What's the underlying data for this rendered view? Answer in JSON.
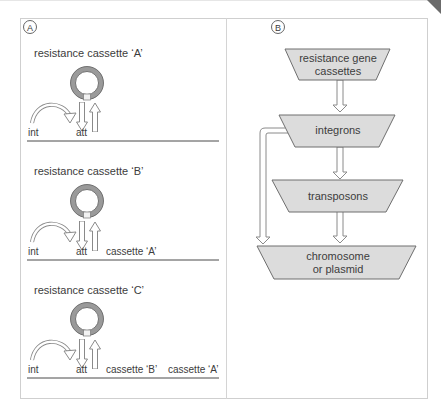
{
  "panel_a": {
    "label": "A",
    "scenarios": [
      {
        "title": "resistance cassette ‘A’",
        "int": "int",
        "att": "att",
        "downstream": []
      },
      {
        "title": "resistance cassette ‘B’",
        "int": "int",
        "att": "att",
        "downstream": [
          "cassette ‘A’"
        ]
      },
      {
        "title": "resistance cassette ‘C’",
        "int": "int",
        "att": "att",
        "downstream": [
          "cassette ‘B’",
          "cassette ‘A’"
        ]
      }
    ]
  },
  "panel_b": {
    "label": "B",
    "nodes": [
      {
        "id": "cassettes",
        "line1": "resistance gene",
        "line2": "cassettes"
      },
      {
        "id": "integrons",
        "line1": "integrons",
        "line2": ""
      },
      {
        "id": "transposons",
        "line1": "transposons",
        "line2": ""
      },
      {
        "id": "chromosome",
        "line1": "chromosome",
        "line2": "or plasmid"
      }
    ],
    "edges": [
      [
        "cassettes",
        "integrons"
      ],
      [
        "integrons",
        "transposons"
      ],
      [
        "transposons",
        "chromosome"
      ],
      [
        "integrons",
        "chromosome"
      ]
    ]
  },
  "colors": {
    "node_fill": "#dcdcdc",
    "node_stroke": "#6e6e6e",
    "ring_fill": "#9a9a9a",
    "ring_stroke": "#5a5a5a",
    "arrow_stroke": "#8a8a8a",
    "baseline": "#4a4a4a"
  }
}
